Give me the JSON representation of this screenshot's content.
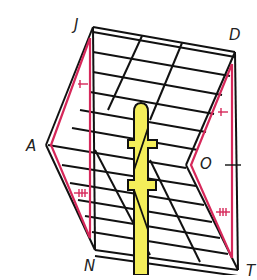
{
  "diagram": {
    "labels": {
      "J": "J",
      "D": "D",
      "A": "A",
      "O": "O",
      "N": "N",
      "T": "T"
    },
    "colors": {
      "outline": "#111111",
      "highlight": "#d6285a",
      "pole": "#f4ee5a",
      "background": "#ffffff"
    },
    "triangles": [
      {
        "name": "JAN",
        "vertices": [
          "J",
          "A",
          "N"
        ],
        "tick_marks": {
          "JA": 1,
          "AN": 3
        }
      },
      {
        "name": "DOT",
        "vertices": [
          "D",
          "O",
          "T"
        ],
        "tick_marks": {
          "DO": 1,
          "OT": 3,
          "DT": 1
        }
      }
    ]
  }
}
